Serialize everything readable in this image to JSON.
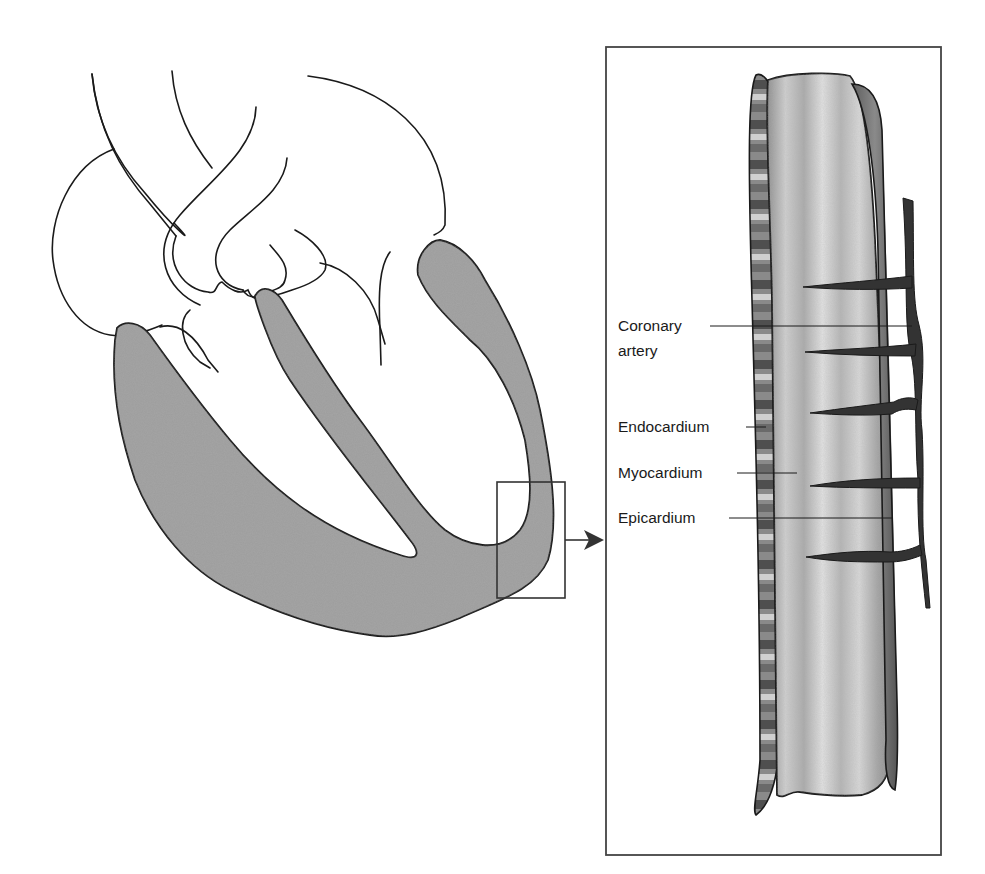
{
  "diagram": {
    "type": "anatomical-illustration",
    "colors": {
      "background": "#ffffff",
      "outline": "#1a1a1a",
      "myocardium_fill": "#9a9a9a",
      "inset_tissue_light": "#c9c9c9",
      "inset_tissue_dark": "#6e6e6e",
      "artery": "#333333",
      "frame": "#444444"
    },
    "heart": {
      "view": "sectioned heart with ventricular wall shaded",
      "magnified_region": "left ventricular wall (boxed)"
    },
    "inset": {
      "description": "magnified cross-section of the heart wall",
      "labels": [
        {
          "id": "coronary-artery",
          "lines": [
            "Coronary",
            "artery"
          ]
        },
        {
          "id": "endocardium",
          "lines": [
            "Endocardium"
          ]
        },
        {
          "id": "myocardium",
          "lines": [
            "Myocardium"
          ]
        },
        {
          "id": "epicardium",
          "lines": [
            "Epicardium"
          ]
        }
      ]
    }
  }
}
